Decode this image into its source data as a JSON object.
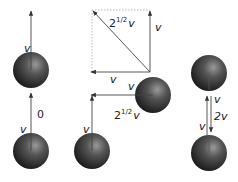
{
  "colors": {
    "ball_dark": "#1a1a1a",
    "ball_light": "#8a8a8a",
    "arrow": "#333333",
    "dashed": "#999999"
  },
  "scenes": [
    {
      "name": "parallel-same-direction",
      "top_ball_label": "v",
      "bottom_ball_label": "v",
      "relative_label": "0"
    },
    {
      "name": "perpendicular",
      "vector_square": {
        "diagonal_label_base": "2",
        "diagonal_label_exp": "1/2",
        "diagonal_label_v": "v",
        "side_label": "v",
        "bottom_label": "v"
      },
      "top_ball_label": "v",
      "top_ball_left_label": "v",
      "bottom_ball_label": "v",
      "relative_label_base": "2",
      "relative_label_exp": "1/2",
      "relative_label_v": "v"
    },
    {
      "name": "head-on",
      "top_ball_label": "v",
      "bottom_ball_label": "v",
      "relative_label": "2v"
    }
  ]
}
